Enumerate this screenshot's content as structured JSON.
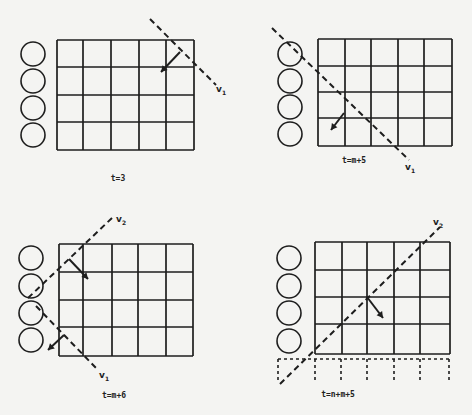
{
  "colors": {
    "ink": "#1e1e1e",
    "background": "#f4f4f2"
  },
  "panels": [
    {
      "id": "panel-t3",
      "caption": "t=3",
      "caption_pos": [
        118,
        181
      ],
      "circles": {
        "cx": 33,
        "cy": [
          54,
          81,
          108,
          135
        ],
        "r": 12
      },
      "grid": {
        "xs": [
          57,
          83,
          111,
          139,
          166,
          194
        ],
        "ys": [
          40,
          67,
          95,
          122,
          150
        ]
      },
      "dashed_grid_row": null,
      "wavefronts": [
        {
          "name": "v",
          "sub": "1",
          "line": [
            150,
            19,
            216,
            85
          ],
          "label_pos": [
            216,
            92
          ],
          "arrow": [
            180,
            52,
            161,
            72
          ]
        }
      ]
    },
    {
      "id": "panel-tm5",
      "caption": "t=m+5",
      "caption_pos": [
        354,
        163
      ],
      "circles": {
        "cx": 290,
        "cy": [
          54,
          81,
          107,
          134
        ],
        "r": 12
      },
      "grid": {
        "xs": [
          318,
          345,
          371,
          398,
          424,
          452
        ],
        "ys": [
          39,
          66,
          92,
          118,
          146
        ]
      },
      "dashed_grid_row": null,
      "wavefronts": [
        {
          "name": "v",
          "sub": "1",
          "line": [
            272,
            28,
            409,
            160
          ],
          "label_pos": [
            405,
            170
          ],
          "arrow": [
            344,
            113,
            331,
            130
          ]
        }
      ]
    },
    {
      "id": "panel-tm6",
      "caption": "t=m+6",
      "caption_pos": [
        114,
        398
      ],
      "circles": {
        "cx": 31,
        "cy": [
          258,
          286,
          313,
          340
        ],
        "r": 12
      },
      "grid": {
        "xs": [
          59,
          83,
          112,
          138,
          166,
          193
        ],
        "ys": [
          244,
          272,
          300,
          327,
          356
        ]
      },
      "dashed_grid_row": null,
      "wavefronts": [
        {
          "name": "v",
          "sub": "2",
          "line": [
            28,
            298,
            112,
            218
          ],
          "label_pos": [
            116,
            222
          ],
          "arrow": [
            69,
            259,
            88,
            279
          ]
        },
        {
          "name": "v",
          "sub": "1",
          "line": [
            36,
            306,
            96,
            368
          ],
          "label_pos": [
            99,
            378
          ],
          "arrow": [
            64,
            335,
            48,
            350
          ]
        }
      ]
    },
    {
      "id": "panel-tnm5",
      "caption": "t=n+m+5",
      "caption_pos": [
        338,
        397
      ],
      "circles": {
        "cx": 289,
        "cy": [
          258,
          286,
          313,
          341
        ],
        "r": 12
      },
      "grid": {
        "xs": [
          315,
          342,
          367,
          394,
          420,
          450
        ],
        "ys": [
          242,
          270,
          297,
          324,
          354
        ]
      },
      "dashed_grid_row": {
        "top": 359,
        "bottom": 380,
        "left": 278,
        "left_bottom": 383,
        "xs": [
          315,
          341,
          367,
          394,
          420,
          449
        ]
      },
      "wavefronts": [
        {
          "name": "v",
          "sub": "2",
          "line": [
            280,
            384,
            440,
            227
          ],
          "label_pos": [
            433,
            225
          ],
          "arrow": [
            367,
            297,
            383,
            318
          ]
        }
      ]
    }
  ]
}
